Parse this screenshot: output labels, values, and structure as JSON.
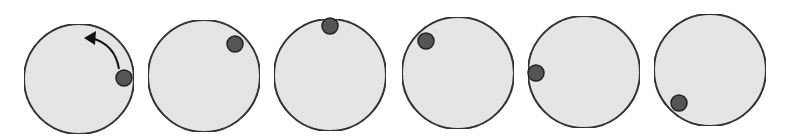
{
  "diagram": {
    "title": "",
    "colors": {
      "background": "#ffffff",
      "circle_fill": "#e6e6e6",
      "circle_stroke": "#222222",
      "ball_fill": "#555555",
      "ball_stroke": "#222222",
      "arrow": "#111111"
    },
    "frames": [
      {
        "cx": 79,
        "cy": 79,
        "r": 55,
        "ball_x": 124,
        "ball_y": 78,
        "ball_r": 8,
        "has_arrow": true
      },
      {
        "cx": 204,
        "cy": 76,
        "r": 56,
        "ball_x": 235,
        "ball_y": 44,
        "ball_r": 8,
        "has_arrow": false
      },
      {
        "cx": 330,
        "cy": 75,
        "r": 56,
        "ball_x": 330,
        "ball_y": 26,
        "ball_r": 8,
        "has_arrow": false
      },
      {
        "cx": 458,
        "cy": 73,
        "r": 56,
        "ball_x": 426,
        "ball_y": 41,
        "ball_r": 8,
        "has_arrow": false
      },
      {
        "cx": 584,
        "cy": 72,
        "r": 56,
        "ball_x": 536,
        "ball_y": 73,
        "ball_r": 8,
        "has_arrow": false
      },
      {
        "cx": 710,
        "cy": 70,
        "r": 56,
        "ball_x": 679,
        "ball_y": 103,
        "ball_r": 8,
        "has_arrow": false
      }
    ],
    "arrow": {
      "icon": "counterclockwise-arrow-icon",
      "path": "M 119 69 Q 115 44 91 38",
      "head": "84,38 96,31 95,45"
    }
  }
}
